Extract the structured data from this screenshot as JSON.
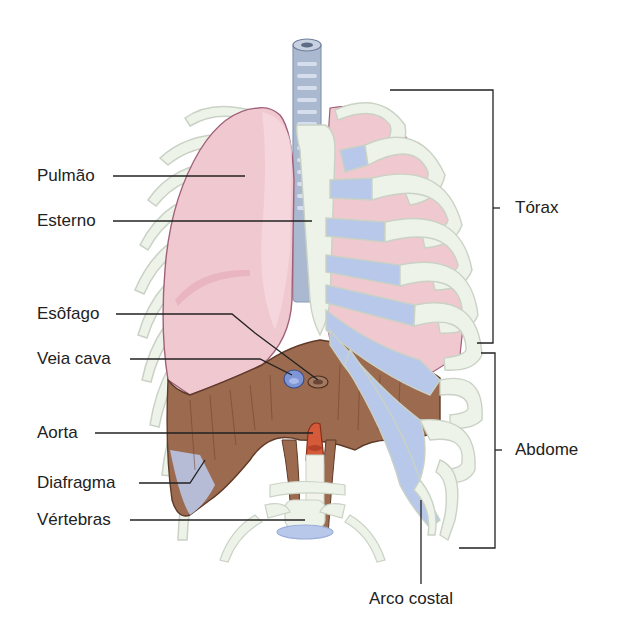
{
  "diagram": {
    "colors": {
      "lung": "#f0c8d0",
      "lung_shade": "#e3a9b6",
      "rib": "#eef3ea",
      "rib_outline": "#c9d2c4",
      "cartilage": "#b8c8ea",
      "diaphragm": "#9c6a4e",
      "diaphragm_dark": "#7c4e36",
      "trachea": "#aab8d0",
      "aorta": "#d45a3a",
      "vena_cava": "#7f96d6",
      "line": "#222222"
    },
    "labels_left": [
      {
        "id": "pulmao",
        "text": "Pulmão"
      },
      {
        "id": "esterno",
        "text": "Esterno"
      },
      {
        "id": "esofago",
        "text": "Esôfago"
      },
      {
        "id": "veia_cava",
        "text": "Veia cava"
      },
      {
        "id": "aorta",
        "text": "Aorta"
      },
      {
        "id": "diafragma",
        "text": "Diafragma"
      },
      {
        "id": "vertebras",
        "text": "Vértebras"
      }
    ],
    "labels_right": [
      {
        "id": "torax",
        "text": "Tórax"
      },
      {
        "id": "abdome",
        "text": "Abdome"
      }
    ],
    "label_bottom": {
      "id": "arco_costal",
      "text": "Arco costal"
    }
  }
}
